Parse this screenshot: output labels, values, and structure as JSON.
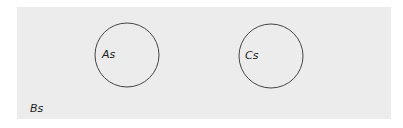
{
  "diagram": {
    "type": "venn-euler",
    "universe": {
      "label": "Bs",
      "background": "#ececec"
    },
    "sets": [
      {
        "label": "As",
        "cx": 127,
        "cy": 55,
        "r": 32,
        "stroke": "#444444"
      },
      {
        "label": "Cs",
        "cx": 271,
        "cy": 56,
        "r": 32,
        "stroke": "#444444"
      }
    ]
  }
}
